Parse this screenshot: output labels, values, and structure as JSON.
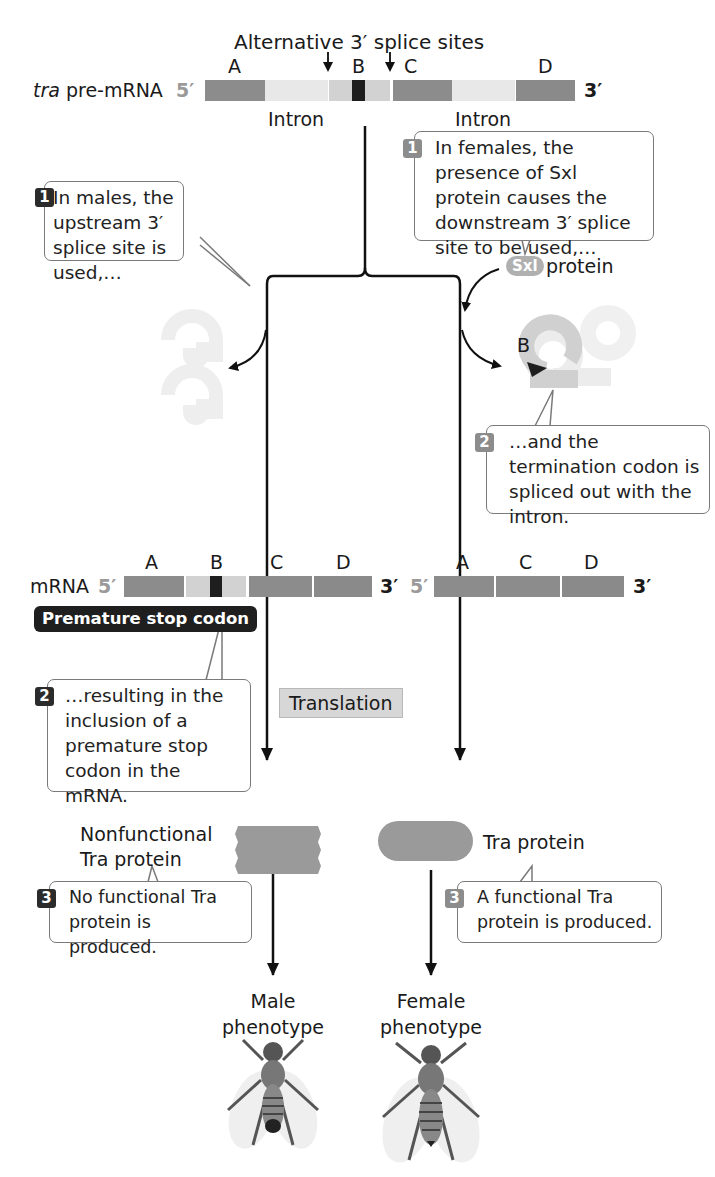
{
  "title": "Alternative 3′ splice sites",
  "pre_mrna": {
    "label_italic": "tra",
    "label_rest": " pre-mRNA",
    "five_prime": "5′",
    "three_prime": "3′",
    "exons": [
      "A",
      "B",
      "C",
      "D"
    ],
    "introns": [
      "Intron",
      "Intron"
    ]
  },
  "callouts": {
    "male_1": {
      "num": "1",
      "text": "In males, the upstream 3′ splice site is used,…"
    },
    "female_1": {
      "num": "1",
      "text": "In females, the presence of Sxl protein causes the downstream 3′ splice site to be used,…"
    },
    "female_2": {
      "num": "2",
      "text": "…and the termination codon is spliced out with the intron."
    },
    "male_2": {
      "num": "2",
      "text": "…resulting in the inclusion of a premature stop codon in the mRNA."
    },
    "male_3": {
      "num": "3",
      "text": "No functional Tra protein is produced."
    },
    "female_3": {
      "num": "3",
      "text": "A functional Tra protein is produced."
    }
  },
  "sxl": {
    "badge": "Sxl",
    "label": "protein"
  },
  "lariat_label": "B",
  "male_mrna": {
    "label": "mRNA",
    "five_prime": "5′",
    "three_prime": "3′",
    "exons": [
      "A",
      "B",
      "C",
      "D"
    ],
    "stop_badge": "Premature stop codon"
  },
  "female_mrna": {
    "five_prime": "5′",
    "three_prime": "3′",
    "exons": [
      "A",
      "C",
      "D"
    ]
  },
  "translation_label": "Translation",
  "male_protein": {
    "line1": "Nonfunctional",
    "line2": "Tra protein"
  },
  "female_protein": {
    "label": "Tra protein"
  },
  "phenotypes": {
    "male": {
      "line1": "Male",
      "line2": "phenotype"
    },
    "female": {
      "line1": "Female",
      "line2": "phenotype"
    }
  },
  "colors": {
    "exon": "#8c8c8c",
    "intron": "#e8e8e8",
    "stop_codon": "#1e1e1e",
    "callout_border": "#7a7a7a",
    "dark_number": "#2b2b2b",
    "light_number": "#8c8c8c"
  }
}
